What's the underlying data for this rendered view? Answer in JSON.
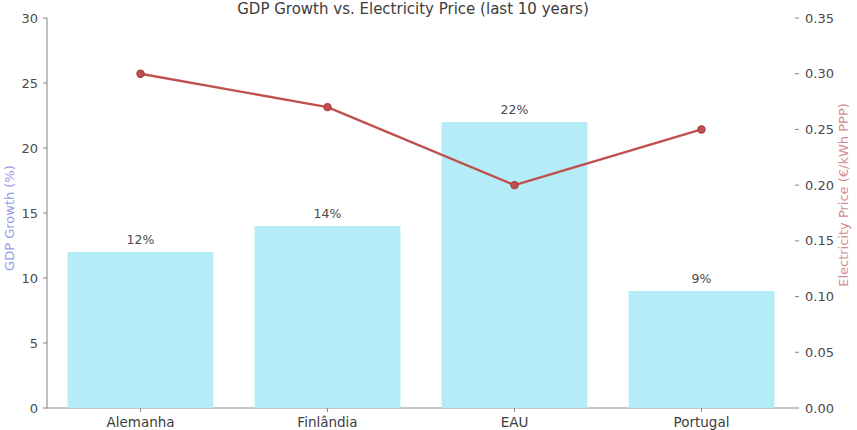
{
  "chart_data": {
    "type": "bar",
    "title": "GDP Growth vs. Electricity Price (last 10 years)",
    "categories": [
      "Alemanha",
      "Finlândia",
      "EAU",
      "Portugal"
    ],
    "series": [
      {
        "name": "GDP Growth (%)",
        "type": "bar",
        "axis": "left",
        "values": [
          12,
          14,
          22,
          9
        ],
        "labels": [
          "12%",
          "14%",
          "22%",
          "9%"
        ],
        "color": "#b4edf7"
      },
      {
        "name": "Electricity Price (€/kWh PPP)",
        "type": "line",
        "axis": "right",
        "values": [
          0.3,
          0.27,
          0.2,
          0.25
        ],
        "color": "#c0504d"
      }
    ],
    "xlabel": "",
    "ylabel": "GDP Growth (%)",
    "ylabel_right": "Electricity Price (€/kWh PPP)",
    "ylim": [
      0,
      30
    ],
    "ylim_right": [
      0.0,
      0.35
    ],
    "yticks": [
      "0",
      "5",
      "10",
      "15",
      "20",
      "25",
      "30"
    ],
    "yticks_right": [
      "0.00",
      "0.05",
      "0.10",
      "0.15",
      "0.20",
      "0.25",
      "0.30",
      "0.35"
    ],
    "grid": false,
    "legend": "none",
    "left_axis_label_color": "#9a9ae6",
    "right_axis_label_color": "#d18c96",
    "axis_color": "#8d8d8d",
    "tick_text_color": "#4a4a4a",
    "background": "#ffffff"
  }
}
